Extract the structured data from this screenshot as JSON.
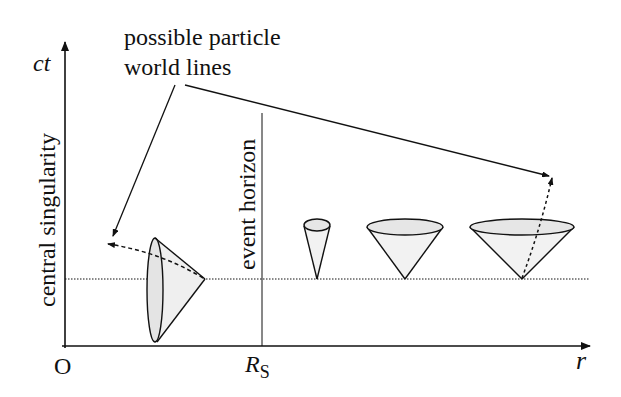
{
  "diagram": {
    "axes": {
      "y_label": "ct",
      "x_label": "r",
      "origin_label": "O",
      "rs_label_main": "R",
      "rs_label_sub": "S"
    },
    "annotations": {
      "central_singularity": "central singularity",
      "event_horizon": "event horizon",
      "world_lines_line1": "possible particle",
      "world_lines_line2": "world lines"
    },
    "colors": {
      "ink": "#111111",
      "cone_fill": "#e6e6e6",
      "background": "#ffffff"
    },
    "light_cones": [
      {
        "region": "inside horizon",
        "orientation": "tilted left (toward singularity)"
      },
      {
        "region": "just outside horizon",
        "orientation": "narrow upright"
      },
      {
        "region": "outside horizon",
        "orientation": "upright, wider"
      },
      {
        "region": "far from horizon",
        "orientation": "upright, widest"
      }
    ]
  }
}
